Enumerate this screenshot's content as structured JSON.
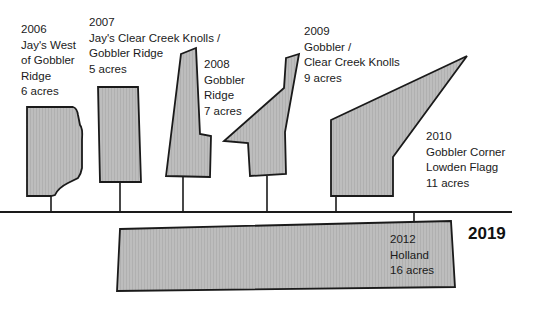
{
  "diagram": {
    "type": "timeline",
    "end_year_label": "2019",
    "fill_color": "#b9b9b9",
    "stroke_color": "#1a1a1a",
    "parcels": [
      {
        "year": "2006",
        "name_lines": [
          "Jay's West",
          "of Gobbler",
          "Ridge"
        ],
        "acres": "6 acres"
      },
      {
        "year": "2007",
        "name_lines": [
          "Jay's Clear Creek Knolls /",
          "Gobbler Ridge"
        ],
        "acres": "5 acres"
      },
      {
        "year": "2008",
        "name_lines": [
          "Gobbler",
          "Ridge"
        ],
        "acres": "7 acres"
      },
      {
        "year": "2009",
        "name_lines": [
          "Gobbler /",
          "Clear Creek Knolls"
        ],
        "acres": "9 acres"
      },
      {
        "year": "2010",
        "name_lines": [
          "Gobbler Corner",
          "Lowden Flagg"
        ],
        "acres": "11 acres"
      },
      {
        "year": "2012",
        "name_lines": [
          "Holland"
        ],
        "acres": "16 acres"
      }
    ]
  }
}
